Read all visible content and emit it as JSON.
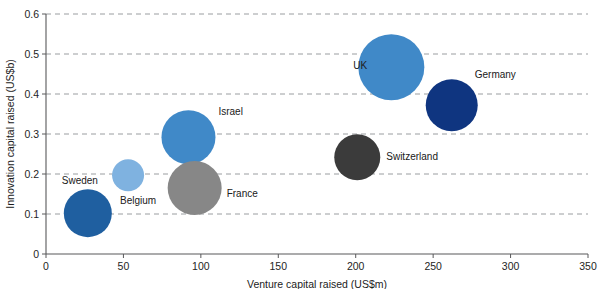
{
  "chart_data": {
    "type": "scatter",
    "title": "",
    "xlabel": "Venture capital raised (US$m)",
    "ylabel": "Innovation capital raised (US$b)",
    "xlim": [
      0,
      350
    ],
    "ylim": [
      0,
      0.6
    ],
    "xticks": [
      "0",
      "50",
      "100",
      "150",
      "200",
      "250",
      "300",
      "350"
    ],
    "xtick_values": [
      0,
      50,
      100,
      150,
      200,
      250,
      300,
      350
    ],
    "yticks": [
      "0",
      "0.1",
      "0.2",
      "0.3",
      "0.4",
      "0.5",
      "0.6"
    ],
    "ytick_values": [
      0,
      0.1,
      0.2,
      0.3,
      0.4,
      0.5,
      0.6
    ],
    "grid": "horizontal-dashed",
    "legend": "none",
    "points": [
      {
        "label": "Sweden",
        "x": 27,
        "y": 0.102,
        "r_px": 24,
        "color": "#1f5fa0",
        "label_dx": -26,
        "label_dy": -29,
        "label_anchor": "start"
      },
      {
        "label": "Belgium",
        "x": 53,
        "y": 0.197,
        "r_px": 16,
        "color": "#7fb2e0",
        "label_dx": -8,
        "label_dy": 29,
        "label_anchor": "start"
      },
      {
        "label": "Israel",
        "x": 92,
        "y": 0.292,
        "r_px": 27,
        "color": "#4089c8",
        "label_dx": 30,
        "label_dy": -22,
        "label_anchor": "start"
      },
      {
        "label": "France",
        "x": 96,
        "y": 0.165,
        "r_px": 27,
        "color": "#878787",
        "label_dx": 32,
        "label_dy": 9,
        "label_anchor": "start"
      },
      {
        "label": "Switzerland",
        "x": 201,
        "y": 0.242,
        "r_px": 23,
        "color": "#3b3b3b",
        "label_dx": 29,
        "label_dy": 3,
        "label_anchor": "start"
      },
      {
        "label": "UK",
        "x": 223,
        "y": 0.467,
        "r_px": 33,
        "color": "#4089c8",
        "label_dx": -38,
        "label_dy": 2,
        "label_anchor": "start"
      },
      {
        "label": "Germany",
        "x": 262,
        "y": 0.372,
        "r_px": 26,
        "color": "#0f3580",
        "label_dx": 23,
        "label_dy": -27,
        "label_anchor": "start"
      }
    ]
  },
  "colors": {
    "axis": "#58585a",
    "gridline": "#8f9295",
    "text": "#1c1c1c",
    "background": "#ffffff"
  }
}
